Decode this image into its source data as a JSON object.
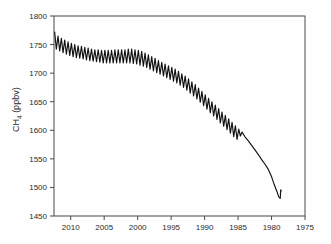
{
  "chart_data": {
    "type": "line",
    "title": "",
    "xlabel": "",
    "ylabel": "CH4 (ppbv)",
    "ylabel_main": "CH",
    "ylabel_sub": "4",
    "ylabel_units": " (ppbv)",
    "xlim": [
      2012.5,
      1975.0
    ],
    "ylim": [
      1450,
      1800
    ],
    "x_reversed": true,
    "grid": false,
    "legend": null,
    "series_color": "#111111",
    "xticks": [
      2010,
      2005,
      2000,
      1995,
      1990,
      1985,
      1980,
      1975
    ],
    "xtick_labels": [
      "2010",
      "2005",
      "2000",
      "1995",
      "1990",
      "1985",
      "1980",
      "1975"
    ],
    "yticks": [
      1450,
      1500,
      1550,
      1600,
      1650,
      1700,
      1750,
      1800
    ],
    "ytick_labels": [
      "1450",
      "1500",
      "1550",
      "1600",
      "1650",
      "1700",
      "1750",
      "1800"
    ],
    "annotations": [],
    "series": [
      {
        "name": "CH4 atmospheric mixing ratio",
        "description": "Monthly-resolution record with seasonal cycle from 2012 back to ~1985, merging into a smoothed firn/ice-core record back to ~1978.5",
        "x": [
          2012.4,
          2012.15,
          2011.9,
          2011.65,
          2011.4,
          2011.15,
          2010.9,
          2010.65,
          2010.4,
          2010.15,
          2009.9,
          2009.65,
          2009.4,
          2009.15,
          2008.9,
          2008.65,
          2008.4,
          2008.15,
          2007.9,
          2007.65,
          2007.4,
          2007.15,
          2006.9,
          2006.65,
          2006.4,
          2006.15,
          2005.9,
          2005.65,
          2005.4,
          2005.15,
          2004.9,
          2004.65,
          2004.4,
          2004.15,
          2003.9,
          2003.65,
          2003.4,
          2003.15,
          2002.9,
          2002.65,
          2002.4,
          2002.15,
          2001.9,
          2001.65,
          2001.4,
          2001.15,
          2000.9,
          2000.65,
          2000.4,
          2000.15,
          1999.9,
          1999.65,
          1999.4,
          1999.15,
          1998.9,
          1998.65,
          1998.4,
          1998.15,
          1997.9,
          1997.65,
          1997.4,
          1997.15,
          1996.9,
          1996.65,
          1996.4,
          1996.15,
          1995.9,
          1995.65,
          1995.4,
          1995.15,
          1994.9,
          1994.65,
          1994.4,
          1994.15,
          1993.9,
          1993.65,
          1993.4,
          1993.15,
          1992.9,
          1992.65,
          1992.4,
          1992.15,
          1991.9,
          1991.65,
          1991.4,
          1991.15,
          1990.9,
          1990.65,
          1990.4,
          1990.15,
          1989.9,
          1989.65,
          1989.4,
          1989.15,
          1988.9,
          1988.65,
          1988.4,
          1988.15,
          1987.9,
          1987.65,
          1987.4,
          1987.15,
          1986.9,
          1986.65,
          1986.4,
          1986.15,
          1985.9,
          1985.65,
          1985.4,
          1985.15,
          1984.9,
          1984.65,
          1984.4,
          1984.0,
          1983.5,
          1983.0,
          1982.5,
          1982.0,
          1981.5,
          1981.0,
          1980.5,
          1980.0,
          1979.6,
          1979.2,
          1978.9,
          1978.7,
          1978.62,
          1978.55
        ],
        "y": [
          1772,
          1742,
          1765,
          1739,
          1761,
          1736,
          1758,
          1733,
          1755,
          1731,
          1752,
          1729,
          1750,
          1727,
          1748,
          1726,
          1747,
          1725,
          1745,
          1723,
          1744,
          1722,
          1742,
          1721,
          1741,
          1720,
          1741,
          1719,
          1740,
          1718,
          1740,
          1718,
          1740,
          1718,
          1740,
          1718,
          1741,
          1718,
          1741,
          1718,
          1741,
          1718,
          1741,
          1718,
          1742,
          1718,
          1742,
          1717,
          1741,
          1716,
          1740,
          1714,
          1738,
          1712,
          1735,
          1710,
          1732,
          1707,
          1729,
          1704,
          1726,
          1701,
          1722,
          1698,
          1719,
          1695,
          1716,
          1692,
          1713,
          1689,
          1710,
          1686,
          1707,
          1683,
          1703,
          1679,
          1699,
          1675,
          1695,
          1670,
          1690,
          1665,
          1685,
          1660,
          1680,
          1655,
          1674,
          1649,
          1668,
          1643,
          1662,
          1637,
          1656,
          1631,
          1650,
          1625,
          1644,
          1619,
          1638,
          1613,
          1632,
          1607,
          1626,
          1601,
          1620,
          1595,
          1614,
          1589,
          1608,
          1584,
          1602,
          1590,
          1597,
          1589,
          1582,
          1574,
          1566,
          1558,
          1549,
          1541,
          1532,
          1519,
          1505,
          1493,
          1483,
          1481,
          1496,
          1494
        ]
      }
    ]
  },
  "axes": {
    "left_px": 54,
    "right_px": 305,
    "top_px": 16,
    "bottom_px": 216
  }
}
